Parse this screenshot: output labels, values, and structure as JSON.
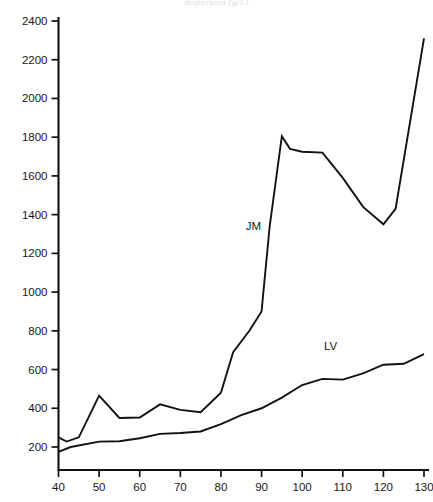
{
  "chart_data": {
    "type": "line",
    "title": "dispersion (g/L)",
    "xlabel": "",
    "ylabel": "",
    "xlim": [
      40,
      130
    ],
    "ylim": [
      100,
      2450
    ],
    "xticks": [
      40,
      50,
      60,
      70,
      80,
      90,
      100,
      110,
      120,
      130
    ],
    "yticks": [
      200,
      400,
      600,
      800,
      1000,
      1200,
      1400,
      1600,
      1800,
      2000,
      2200,
      2400
    ],
    "grid": false,
    "legend_position": "inline-annotation",
    "series": [
      {
        "name": "JM",
        "label_x": 88,
        "label_y": 1320,
        "color": "#121212",
        "x": [
          40,
          42,
          45,
          50,
          55,
          60,
          65,
          70,
          75,
          80,
          83,
          87,
          90,
          92,
          95,
          97,
          100,
          105,
          110,
          115,
          120,
          123,
          130
        ],
        "y": [
          250,
          228,
          250,
          465,
          350,
          352,
          420,
          392,
          380,
          480,
          690,
          800,
          900,
          1340,
          1805,
          1740,
          1725,
          1720,
          1590,
          1440,
          1350,
          1430,
          2310
        ]
      },
      {
        "name": "LV",
        "label_x": 107,
        "label_y": 700,
        "color": "#121212",
        "x": [
          40,
          43,
          50,
          55,
          60,
          65,
          70,
          75,
          80,
          85,
          90,
          95,
          100,
          105,
          110,
          115,
          120,
          125,
          130
        ],
        "y": [
          175,
          200,
          228,
          230,
          245,
          268,
          272,
          280,
          318,
          365,
          400,
          455,
          520,
          552,
          548,
          580,
          625,
          630,
          680
        ]
      }
    ]
  },
  "axis": {
    "y_tick_labels": [
      "2400",
      "2200",
      "2000",
      "1800",
      "1600",
      "1400",
      "1200",
      "1000",
      "800",
      "600",
      "400",
      "200"
    ],
    "x_tick_labels": [
      "40",
      "50",
      "60",
      "70",
      "80",
      "90",
      "100",
      "110",
      "120",
      "130"
    ]
  }
}
